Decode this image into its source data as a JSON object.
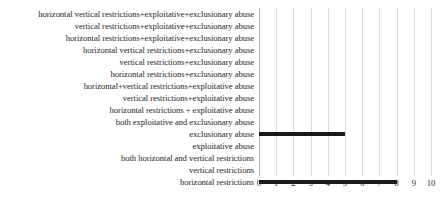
{
  "chart_data": {
    "type": "bar",
    "orientation": "horizontal",
    "title": "",
    "xlabel": "",
    "ylabel": "",
    "xlim": [
      0,
      10
    ],
    "xticks": [
      "0",
      "1",
      "2",
      "3",
      "4",
      "5",
      "6",
      "7",
      "8",
      "9",
      "10"
    ],
    "grid": "vertical",
    "legend": "none",
    "bar_color": "#1a1a1a",
    "gridline_color": "#dcdcdc",
    "axis_color": "#b4b4b4",
    "categories": [
      "horizontal vertical restrictions+exploitative+exclusionary abuse",
      "vertical restrictions+exploitative+exclusionary abuse",
      "horizontal restrictions+exploitative+exclusionary abuse",
      "horizontal vertical restrictions+exclusionary abuse",
      "vertical restrictions+exclusionary abuse",
      "horizontal restrictions+exclusionary abuse",
      "horizontal+vertical restrictions+exploitative abuse",
      "vertical restrictions+exploitative abuse",
      "horizontal restrictions + exploitative abuse",
      "both exploitative and exclusionary abuse",
      "exclusionary abuse",
      "exploitative abuse",
      "both horizontal and vertical restrictions",
      "vertical restrictions",
      "horizontal restrictions"
    ],
    "values": [
      0,
      0,
      0,
      0,
      0,
      0,
      0,
      0,
      0,
      0,
      5,
      0,
      0,
      0,
      8
    ]
  }
}
